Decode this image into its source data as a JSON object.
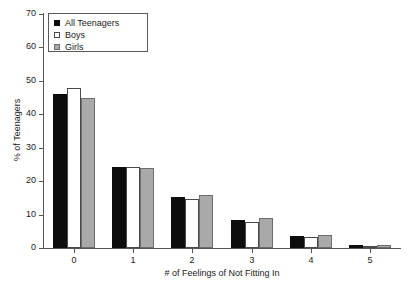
{
  "chart_data": {
    "type": "bar",
    "title": "",
    "xlabel": "# of Feelings of Not Fitting In",
    "ylabel": "% of Teenagers",
    "categories": [
      "0",
      "1",
      "2",
      "3",
      "4",
      "5"
    ],
    "series": [
      {
        "name": "All Teenagers",
        "color": "#0d0d0d",
        "values": [
          46.2,
          24.2,
          15.3,
          8.3,
          3.5,
          1.0
        ]
      },
      {
        "name": "Boys",
        "color": "#ffffff",
        "values": [
          47.8,
          24.3,
          14.8,
          7.7,
          3.3,
          0.7
        ]
      },
      {
        "name": "Girls",
        "color": "#a9a9a9",
        "values": [
          44.8,
          23.9,
          15.9,
          8.9,
          4.0,
          1.0
        ]
      }
    ],
    "ylim": [
      0,
      70
    ],
    "y_ticks": [
      "0",
      "10",
      "20",
      "30",
      "40",
      "50",
      "60",
      "70"
    ],
    "y_tick_values": [
      0,
      10,
      20,
      30,
      40,
      50,
      60,
      70
    ],
    "grid": false,
    "legend_position": "top-left"
  },
  "caption_sliver": ""
}
